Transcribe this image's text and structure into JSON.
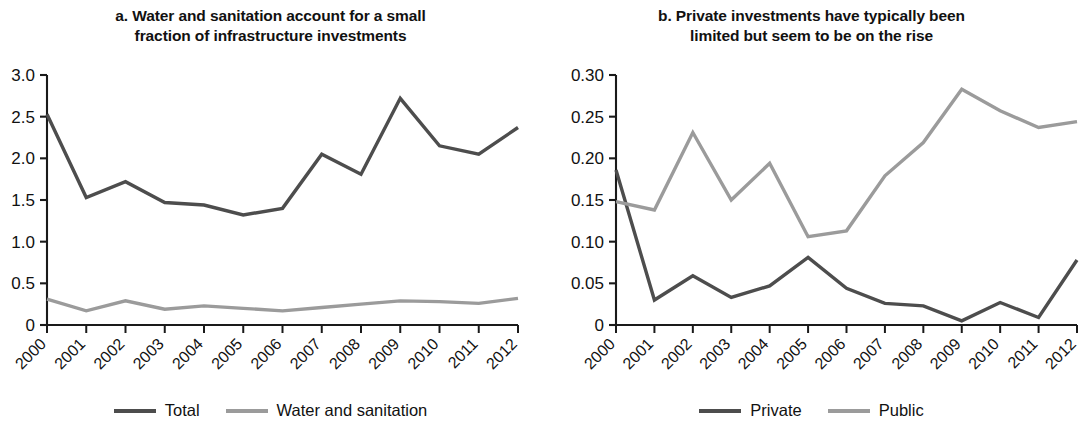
{
  "figure": {
    "background": "#ffffff",
    "colors": {
      "dark_series": "#4d4d4d",
      "light_series": "#9b9b9b",
      "axis": "#1a1a1a",
      "text": "#111111"
    }
  },
  "panels": [
    {
      "id": "panel-a",
      "title": "a. Water and sanitation account for a small fraction of infrastructure investments",
      "title_line1": "a. Water and sanitation account for a small",
      "title_line2": "fraction of infrastructure investments",
      "legend": [
        {
          "label": "Total",
          "color": "#4d4d4d"
        },
        {
          "label": "Water and sanitation",
          "color": "#9b9b9b"
        }
      ]
    },
    {
      "id": "panel-b",
      "title": "b. Private investments have typically been limited but seem to be on the rise",
      "title_line1": "b. Private investments have typically been",
      "title_line2": "limited but seem to be on the rise",
      "legend": [
        {
          "label": "Private",
          "color": "#4d4d4d"
        },
        {
          "label": "Public",
          "color": "#9b9b9b"
        }
      ]
    }
  ],
  "chart_data": [
    {
      "type": "line",
      "panel": "a",
      "title": "a. Water and sanitation account for a small fraction of infrastructure investments",
      "xlabel": "",
      "ylabel": "",
      "categories": [
        "2000",
        "2001",
        "2002",
        "2003",
        "2004",
        "2005",
        "2006",
        "2007",
        "2008",
        "2009",
        "2010",
        "2011",
        "2012"
      ],
      "ytick_labels": [
        "0",
        "0.5",
        "1.0",
        "1.5",
        "2.0",
        "2.5",
        "3.0"
      ],
      "ytick_values": [
        0,
        0.5,
        1.0,
        1.5,
        2.0,
        2.5,
        3.0
      ],
      "ylim": [
        0,
        3.0
      ],
      "grid": false,
      "legend_position": "bottom",
      "series": [
        {
          "name": "Total",
          "color": "#4d4d4d",
          "values": [
            2.53,
            1.53,
            1.72,
            1.47,
            1.44,
            1.32,
            1.4,
            2.05,
            1.81,
            2.72,
            2.15,
            2.05,
            2.37
          ]
        },
        {
          "name": "Water and sanitation",
          "color": "#9b9b9b",
          "values": [
            0.31,
            0.17,
            0.29,
            0.19,
            0.23,
            0.2,
            0.17,
            0.21,
            0.25,
            0.29,
            0.28,
            0.26,
            0.32
          ]
        }
      ]
    },
    {
      "type": "line",
      "panel": "b",
      "title": "b. Private investments have typically been limited but seem to be on the rise",
      "xlabel": "",
      "ylabel": "",
      "categories": [
        "2000",
        "2001",
        "2002",
        "2003",
        "2004",
        "2005",
        "2006",
        "2007",
        "2008",
        "2009",
        "2010",
        "2011",
        "2012"
      ],
      "ytick_labels": [
        "0",
        "0.05",
        "0.10",
        "0.15",
        "0.20",
        "0.25",
        "0.30"
      ],
      "ytick_values": [
        0,
        0.05,
        0.1,
        0.15,
        0.2,
        0.25,
        0.3
      ],
      "ylim": [
        0,
        0.3
      ],
      "grid": false,
      "legend_position": "bottom",
      "series": [
        {
          "name": "Private",
          "color": "#4d4d4d",
          "values": [
            0.186,
            0.03,
            0.059,
            0.033,
            0.047,
            0.081,
            0.044,
            0.026,
            0.023,
            0.005,
            0.027,
            0.009,
            0.078
          ]
        },
        {
          "name": "Public",
          "color": "#9b9b9b",
          "values": [
            0.148,
            0.138,
            0.231,
            0.15,
            0.194,
            0.106,
            0.113,
            0.179,
            0.219,
            0.283,
            0.257,
            0.237,
            0.244
          ]
        }
      ]
    }
  ]
}
